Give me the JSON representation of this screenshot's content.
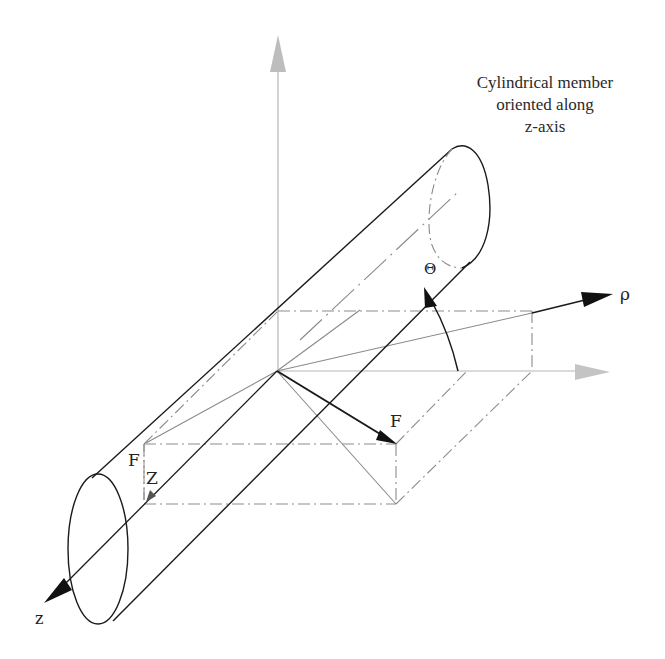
{
  "figure": {
    "caption_lines": [
      "Cylindrical member",
      "oriented along",
      "z-axis"
    ],
    "labels": {
      "rho": "ρ",
      "theta": "Θ",
      "force": "F",
      "force_z_F": "F",
      "force_z_Z": "Z",
      "z_axis": "z"
    },
    "colors": {
      "ink": "#1a1a1a",
      "gray_axis": "#b0b0b0",
      "construction": "#8a8a8a",
      "background": "#ffffff"
    }
  }
}
